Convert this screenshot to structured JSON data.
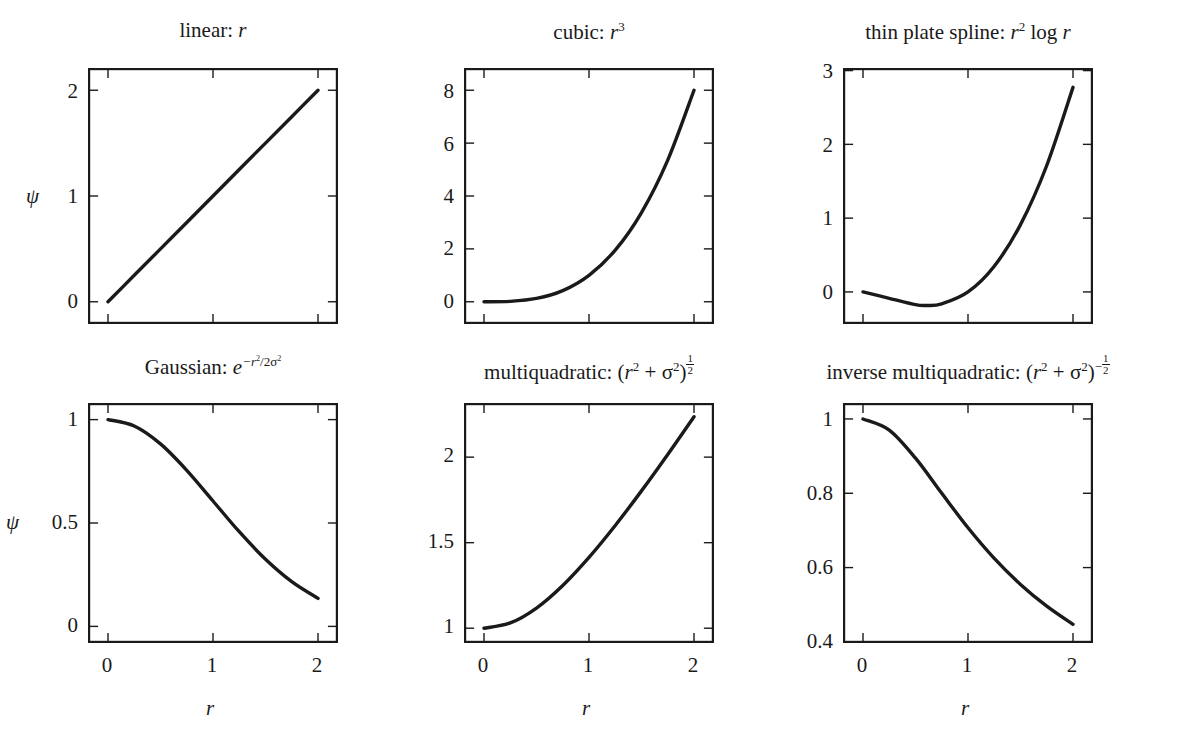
{
  "figure": {
    "background_color": "#ffffff",
    "line_color": "#1a1a1a",
    "rows": 2,
    "columns": 3
  },
  "axis_labels": {
    "x": "r",
    "y": "ψ"
  },
  "panels": [
    {
      "id": "linear",
      "title_plain": "linear: r",
      "title_name": "linear",
      "xlabel": "r",
      "ylabel": "ψ",
      "xticks": [
        0,
        1,
        2
      ],
      "xticklabels": [
        "",
        "",
        ""
      ],
      "yticks": [
        0,
        1,
        2
      ],
      "yticklabels": [
        "0",
        "1",
        "2"
      ],
      "xlim": [
        -0.18,
        2.18
      ],
      "ylim": [
        -0.2,
        2.2
      ]
    },
    {
      "id": "cubic",
      "title_plain": "cubic: r3",
      "title_name": "cubic",
      "xlabel": "r",
      "ylabel": "",
      "xticks": [
        0,
        1,
        2
      ],
      "xticklabels": [
        "",
        "",
        ""
      ],
      "yticks": [
        0,
        2,
        4,
        6,
        8
      ],
      "yticklabels": [
        "0",
        "2",
        "4",
        "6",
        "8"
      ],
      "xlim": [
        -0.18,
        2.18
      ],
      "ylim": [
        -0.8,
        8.8
      ]
    },
    {
      "id": "thin-plate-spline",
      "title_plain": "thin plate spline: r2 log r",
      "title_name": "thin plate spline",
      "xlabel": "r",
      "ylabel": "",
      "xticks": [
        0,
        1,
        2
      ],
      "xticklabels": [
        "",
        "",
        ""
      ],
      "yticks": [
        0,
        1,
        2,
        3
      ],
      "yticklabels": [
        "0",
        "1",
        "2",
        "3"
      ],
      "xlim": [
        -0.18,
        2.18
      ],
      "ylim": [
        -0.42,
        3.02
      ]
    },
    {
      "id": "gaussian",
      "title_plain": "Gaussian: e-r2/2σ2",
      "title_name": "Gaussian",
      "xlabel": "r",
      "ylabel": "ψ",
      "xticks": [
        0,
        1,
        2
      ],
      "xticklabels": [
        "0",
        "1",
        "2"
      ],
      "yticks": [
        0,
        0.5,
        1
      ],
      "yticklabels": [
        "0",
        "0.5",
        "1"
      ],
      "xlim": [
        -0.18,
        2.18
      ],
      "ylim": [
        -0.075,
        1.075
      ]
    },
    {
      "id": "multiquadratic",
      "title_plain": "multiquadratic: (r2 + σ2)1/2",
      "title_name": "multiquadratic",
      "xlabel": "r",
      "ylabel": "",
      "xticks": [
        0,
        1,
        2
      ],
      "xticklabels": [
        "0",
        "1",
        "2"
      ],
      "yticks": [
        1,
        1.5,
        2
      ],
      "yticklabels": [
        "1",
        "1.5",
        "2"
      ],
      "xlim": [
        -0.18,
        2.18
      ],
      "ylim": [
        0.92,
        2.31
      ]
    },
    {
      "id": "inverse-multiquadratic",
      "title_plain": "inverse multiquadratic: (r2 + σ2)-1/2",
      "title_name": "inverse multiquadratic",
      "xlabel": "r",
      "ylabel": "",
      "xticks": [
        0,
        1,
        2
      ],
      "xticklabels": [
        "0",
        "1",
        "2"
      ],
      "yticks": [
        0.4,
        0.6,
        0.8,
        1
      ],
      "yticklabels": [
        "0.4",
        "0.6",
        "0.8",
        "1"
      ],
      "xlim": [
        -0.18,
        2.18
      ],
      "ylim": [
        0.4,
        1.04
      ]
    }
  ],
  "chart_data": [
    {
      "type": "line",
      "title": "linear: r",
      "xlabel": "r",
      "ylabel": "ψ",
      "xlim": [
        -0.18,
        2.18
      ],
      "ylim": [
        -0.2,
        2.2
      ],
      "xticks": [
        0,
        1,
        2
      ],
      "yticks": [
        0,
        1,
        2
      ],
      "grid": false,
      "legend": "none",
      "x": [
        0,
        0.25,
        0.5,
        0.75,
        1,
        1.25,
        1.5,
        1.75,
        2
      ],
      "y": [
        0,
        0.25,
        0.5,
        0.75,
        1,
        1.25,
        1.5,
        1.75,
        2
      ]
    },
    {
      "type": "line",
      "title": "cubic: r^3",
      "xlabel": "r",
      "ylabel": "",
      "xlim": [
        -0.18,
        2.18
      ],
      "ylim": [
        -0.8,
        8.8
      ],
      "xticks": [
        0,
        1,
        2
      ],
      "yticks": [
        0,
        2,
        4,
        6,
        8
      ],
      "grid": false,
      "legend": "none",
      "x": [
        0,
        0.25,
        0.5,
        0.75,
        1,
        1.25,
        1.5,
        1.75,
        2
      ],
      "y": [
        0,
        0.016,
        0.125,
        0.422,
        1,
        1.953,
        3.375,
        5.359,
        8
      ]
    },
    {
      "type": "line",
      "title": "thin plate spline: r^2 log r",
      "xlabel": "r",
      "ylabel": "",
      "xlim": [
        -0.18,
        2.18
      ],
      "ylim": [
        -0.42,
        3.02
      ],
      "xticks": [
        0,
        1,
        2
      ],
      "yticks": [
        0,
        1,
        2,
        3
      ],
      "grid": false,
      "legend": "none",
      "x": [
        0,
        0.25,
        0.5,
        0.606,
        0.75,
        1,
        1.25,
        1.5,
        1.75,
        2
      ],
      "y": [
        0,
        -0.0866,
        -0.1733,
        -0.1839,
        -0.1618,
        0,
        0.3486,
        0.9123,
        1.7135,
        2.7726
      ]
    },
    {
      "type": "line",
      "title": "Gaussian: e^{-r^2/2σ^2}",
      "xlabel": "r",
      "ylabel": "ψ",
      "xlim": [
        -0.18,
        2.18
      ],
      "ylim": [
        -0.075,
        1.075
      ],
      "xticks": [
        0,
        1,
        2
      ],
      "yticks": [
        0,
        0.5,
        1
      ],
      "grid": false,
      "legend": "none",
      "x": [
        0,
        0.25,
        0.5,
        0.75,
        1,
        1.25,
        1.5,
        1.75,
        2
      ],
      "y": [
        1,
        0.9692,
        0.8825,
        0.7548,
        0.6065,
        0.4578,
        0.3247,
        0.2163,
        0.1353
      ]
    },
    {
      "type": "line",
      "title": "multiquadratic: (r^2 + σ^2)^{1/2}",
      "xlabel": "r",
      "ylabel": "",
      "xlim": [
        -0.18,
        2.18
      ],
      "ylim": [
        0.92,
        2.31
      ],
      "xticks": [
        0,
        1,
        2
      ],
      "yticks": [
        1,
        1.5,
        2
      ],
      "grid": false,
      "legend": "none",
      "x": [
        0,
        0.25,
        0.5,
        0.75,
        1,
        1.25,
        1.5,
        1.75,
        2
      ],
      "y": [
        1,
        1.0308,
        1.118,
        1.25,
        1.4142,
        1.6008,
        1.8028,
        2.0156,
        2.2361
      ]
    },
    {
      "type": "line",
      "title": "inverse multiquadratic: (r^2 + σ^2)^{-1/2}",
      "xlabel": "r",
      "ylabel": "",
      "xlim": [
        0.4,
        1.04
      ],
      "ylim": [
        0.4,
        1.04
      ],
      "xticks": [
        0,
        1,
        2
      ],
      "yticks": [
        0.4,
        0.6,
        0.8,
        1
      ],
      "grid": false,
      "legend": "none",
      "x": [
        0,
        0.25,
        0.5,
        0.75,
        1,
        1.25,
        1.5,
        1.75,
        2
      ],
      "y": [
        1,
        0.9701,
        0.8944,
        0.8,
        0.7071,
        0.6247,
        0.5547,
        0.4961,
        0.4472
      ]
    }
  ]
}
